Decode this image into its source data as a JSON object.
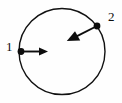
{
  "figure": {
    "background_color": "#fefefe",
    "stroke_color": "#111111",
    "circle": {
      "name": "circular-path",
      "center_x": 62,
      "center_y": 51.5,
      "radius": 43,
      "stroke_width": 1.4,
      "fill": "none"
    },
    "points": [
      {
        "label": "1",
        "name": "point-1",
        "x": 21,
        "y": 51.5,
        "dot_radius": 3.4,
        "vector": {
          "name": "vector-1",
          "from_x": 21,
          "from_y": 51.5,
          "to_x": 48,
          "to_y": 51.5,
          "direction": "right",
          "head_length": 9,
          "head_width": 8,
          "shaft_width": 1.9
        },
        "label_x": 6,
        "label_y": 40
      },
      {
        "label": "2",
        "name": "point-2",
        "x": 97,
        "y": 26,
        "dot_radius": 3.4,
        "vector": {
          "name": "vector-2",
          "from_x": 97,
          "from_y": 26,
          "to_x": 67,
          "to_y": 41,
          "direction": "down-left",
          "head_length": 11,
          "head_width": 9,
          "shaft_width": 1.9
        },
        "label_x": 108,
        "label_y": 10
      }
    ]
  }
}
